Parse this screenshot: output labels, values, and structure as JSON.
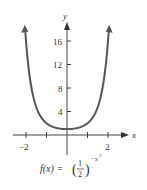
{
  "chart_data": {
    "type": "line",
    "title": "",
    "function_label": "f(x) = (1/2)^(-x^2)",
    "formula": {
      "lhs": "f(x) =",
      "base_num": "1",
      "base_den": "2",
      "exponent": "−x",
      "exponent_power": "2"
    },
    "xlabel": "x",
    "ylabel": "y",
    "x_ticks": [
      -2,
      -1,
      1,
      2
    ],
    "x_tick_labels": [
      "−2",
      "2"
    ],
    "y_ticks": [
      4,
      8,
      12,
      16
    ],
    "y_tick_labels": [
      "4",
      "8",
      "12",
      "16"
    ],
    "xlim": [
      -2.8,
      3.0
    ],
    "ylim": [
      0,
      18
    ],
    "grid": false,
    "series": [
      {
        "name": "f(x) = (1/2)^(-x^2)",
        "x": [
          -2.05,
          -2,
          -1.75,
          -1.5,
          -1.25,
          -1,
          -0.75,
          -0.5,
          -0.25,
          0,
          0.25,
          0.5,
          0.75,
          1,
          1.25,
          1.5,
          1.75,
          2,
          2.05
        ],
        "y": [
          18.4,
          16,
          8.3,
          4.76,
          2.95,
          2,
          1.48,
          1.19,
          1.04,
          1,
          1.04,
          1.19,
          1.48,
          2,
          2.95,
          4.76,
          8.3,
          16,
          18.4
        ]
      }
    ],
    "colors": {
      "curve": "#555555",
      "axes": "#444444"
    }
  }
}
